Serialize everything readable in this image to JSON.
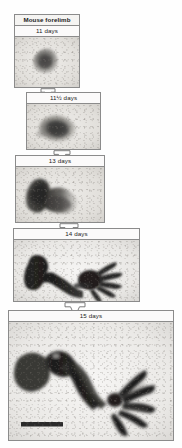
{
  "figure": {
    "title": "Mouse forelimb",
    "caption_visible": false,
    "background_color": "#fefefe",
    "border_color": "#8b8b8b"
  },
  "stages": [
    {
      "id": "stage-11-days",
      "title": "Mouse forelimb",
      "label": "11 days",
      "has_title_row": true,
      "specimen": "limb-bud-round",
      "scalebar": false
    },
    {
      "id": "stage-11-5-days",
      "title": "",
      "label": "11½ days",
      "has_title_row": false,
      "specimen": "limb-bud-elongating",
      "scalebar": false
    },
    {
      "id": "stage-13-days",
      "title": "",
      "label": "13 days",
      "has_title_row": false,
      "specimen": "limb-paddle",
      "scalebar": false
    },
    {
      "id": "stage-14-days",
      "title": "",
      "label": "14 days",
      "has_title_row": false,
      "specimen": "limb-digits-forming",
      "scalebar": false
    },
    {
      "id": "stage-15-days",
      "title": "",
      "label": "15 days",
      "has_title_row": false,
      "specimen": "limb-digits-separated",
      "scalebar": true
    }
  ],
  "arrows": [
    {
      "id": "arrow-11-to-11-5",
      "from": "11 days",
      "to": "11½ days"
    },
    {
      "id": "arrow-11-5-to-13",
      "from": "11½ days",
      "to": "13 days"
    },
    {
      "id": "arrow-13-to-14",
      "from": "13 days",
      "to": "14 days"
    },
    {
      "id": "arrow-14-to-15",
      "from": "14 days",
      "to": "15 days"
    }
  ],
  "scalebar": {
    "label": "",
    "color": "#2a2a2a"
  }
}
